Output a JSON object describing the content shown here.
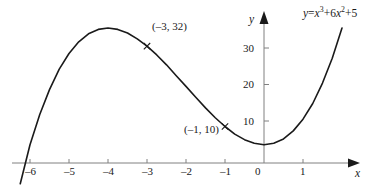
{
  "chart_data": {
    "type": "line",
    "title": "",
    "xlabel": "x",
    "ylabel": "y",
    "equation_text": "y = x³ + 6x² + 5",
    "function": "y = x^3 + 6x^2 + 5",
    "xlim": [
      -6.25,
      2.1
    ],
    "ylim": [
      -6,
      42
    ],
    "grid": false,
    "legend": "none",
    "x_ticks": [
      -6,
      -5,
      -4,
      -3,
      -2,
      -1,
      0,
      1
    ],
    "x_tick_labels": [
      "–6",
      "–5",
      "–4",
      "–3",
      "–2",
      "–1",
      "0",
      "1"
    ],
    "y_ticks": [
      10,
      20,
      30
    ],
    "y_tick_labels": [
      "10",
      "20",
      "30"
    ],
    "series": [
      {
        "name": "y = x^3 + 6x^2 + 5",
        "x": [
          -6.25,
          -6.0,
          -5.75,
          -5.5,
          -5.25,
          -5.0,
          -4.75,
          -4.5,
          -4.25,
          -4.0,
          -3.75,
          -3.5,
          -3.25,
          -3.0,
          -2.75,
          -2.5,
          -2.25,
          -2.0,
          -1.75,
          -1.5,
          -1.25,
          -1.0,
          -0.75,
          -0.5,
          -0.25,
          0.0,
          0.25,
          0.5,
          0.75,
          1.0,
          1.25,
          1.5,
          1.75,
          2.0
        ],
        "y": [
          -5.7,
          5.0,
          13.3,
          20.1,
          25.7,
          30.0,
          33.2,
          35.4,
          36.6,
          37.0,
          36.6,
          35.6,
          34.0,
          32.0,
          29.6,
          26.9,
          23.9,
          21.0,
          18.0,
          15.1,
          12.4,
          10.0,
          7.9,
          6.4,
          5.4,
          5.0,
          5.4,
          6.6,
          8.8,
          12.0,
          16.3,
          21.9,
          28.7,
          37.0
        ]
      }
    ],
    "annotations": [
      {
        "text": "(–3, 32)",
        "point_x": -3,
        "point_y": 32,
        "marker": "cross",
        "label_dx": 8,
        "label_dy": -15
      },
      {
        "text": "(–1, 10)",
        "point_x": -1,
        "point_y": 10,
        "marker": "cross",
        "label_dx": -56,
        "label_dy": 13
      }
    ],
    "curve_color": "#1a1a1a",
    "axis_color": "#808080"
  },
  "axes": {
    "y_axis_name": "y",
    "x_axis_name": "x"
  },
  "equation": {
    "lhs": "y",
    "eq_sign": "=",
    "term1_base": "x",
    "term1_exp": "3",
    "plus1": "+",
    "term2_coef": "6",
    "term2_base": "x",
    "term2_exp": "2",
    "plus2": "+",
    "term3": "5"
  },
  "ticks": {
    "x": [
      {
        "label": "–6"
      },
      {
        "label": "–5"
      },
      {
        "label": "–4"
      },
      {
        "label": "–3"
      },
      {
        "label": "–2"
      },
      {
        "label": "–1"
      },
      {
        "label": "0"
      },
      {
        "label": "1"
      }
    ],
    "y": [
      {
        "label": "30"
      },
      {
        "label": "20"
      },
      {
        "label": "10"
      }
    ]
  },
  "annotations": {
    "point_a": "(–3, 32)",
    "point_b": "(–1, 10)"
  }
}
